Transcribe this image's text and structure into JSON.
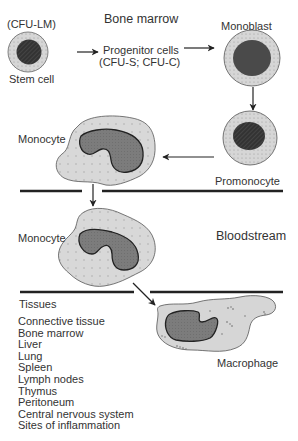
{
  "regions": {
    "bone_marrow": "Bone marrow",
    "bloodstream": "Bloodstream",
    "tissues": "Tissues"
  },
  "cells": {
    "stem_cell": {
      "label": "Stem cell",
      "sublabel": "(CFU-LM)"
    },
    "progenitor": {
      "line1": "Progenitor cells",
      "line2": "(CFU-S; CFU-C)"
    },
    "monoblast": {
      "label": "Monoblast"
    },
    "promonocyte": {
      "label": "Promonocyte"
    },
    "monocyte_marrow": {
      "label": "Monocyte"
    },
    "monocyte_blood": {
      "label": "Monocyte"
    },
    "macrophage": {
      "label": "Macrophage"
    }
  },
  "tissue_list": [
    "Connective tissue",
    "Bone marrow",
    "Liver",
    "Lung",
    "Spleen",
    "Lymph nodes",
    "Thymus",
    "Peritoneum",
    "Central nervous system",
    "Sites of inflammation"
  ],
  "colors": {
    "cytoplasm": "#d4d4d4",
    "nucleus_dark": "#2a2a2a",
    "nucleus_mid": "#7a7a7a",
    "line": "#222222"
  }
}
